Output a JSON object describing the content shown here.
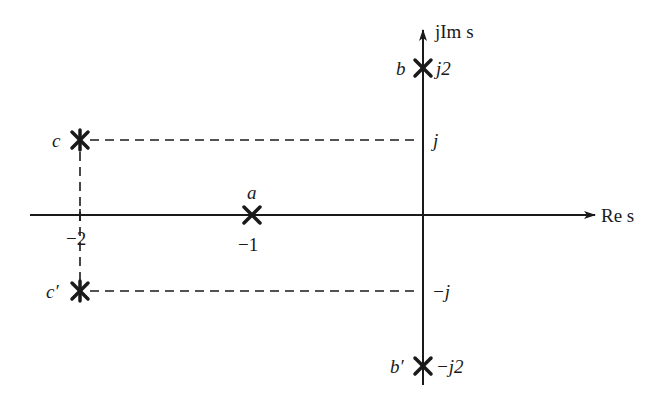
{
  "diagram": {
    "colors": {
      "ink": "#1a1a1a",
      "background": "#ffffff"
    },
    "axes": {
      "real_label": "Re s",
      "imag_label": "jIm s",
      "real_ticks": [
        {
          "value": -2,
          "label": "−2"
        },
        {
          "value": -1,
          "label": "−1"
        }
      ],
      "imag_ticks": [
        {
          "value": 2,
          "label": "j2"
        },
        {
          "value": 1,
          "label": "j"
        },
        {
          "value": -1,
          "label": "−j"
        },
        {
          "value": -2,
          "label": "−j2"
        }
      ]
    },
    "points": [
      {
        "name": "a",
        "re": -1,
        "im": 0,
        "label": "a"
      },
      {
        "name": "b",
        "re": 0,
        "im": 2,
        "label": "b"
      },
      {
        "name": "b_prime",
        "re": 0,
        "im": -2,
        "label": "b′"
      },
      {
        "name": "c",
        "re": -2,
        "im": 1,
        "label": "c"
      },
      {
        "name": "c_prime",
        "re": -2,
        "im": -1,
        "label": "c′"
      }
    ]
  }
}
